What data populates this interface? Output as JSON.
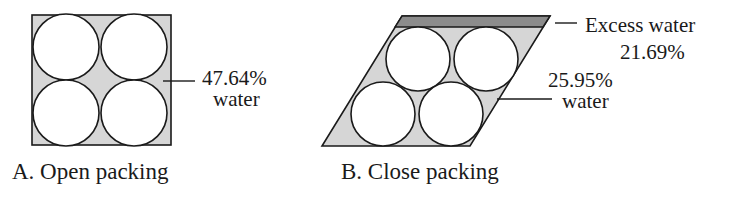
{
  "panel_a": {
    "caption": "A. Open packing",
    "water_percent": "47.64%",
    "water_label": "water"
  },
  "panel_b": {
    "caption": "B. Close packing",
    "excess_label": "Excess water",
    "excess_percent": "21.69%",
    "water_percent": "25.95%",
    "water_label": "water"
  },
  "colors": {
    "pore_fill": "#d6d6d6",
    "excess_fill": "#8c8c8c",
    "outline": "#1a1a1a",
    "grain_fill": "#ffffff"
  }
}
